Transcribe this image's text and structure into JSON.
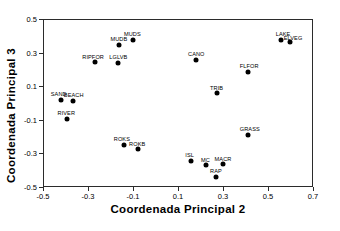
{
  "chart_data": {
    "type": "scatter",
    "title": "",
    "xlabel": "Coordenada Principal 2",
    "ylabel": "Coordenada Principal 3",
    "xlim": [
      -0.5,
      0.7
    ],
    "ylim": [
      -0.5,
      0.5
    ],
    "xticks": [
      "-0.5",
      "-0.3",
      "-0.1",
      "0.1",
      "0.3",
      "0.5",
      "0.7"
    ],
    "xtick_values": [
      -0.5,
      -0.3,
      -0.1,
      0.1,
      0.3,
      0.5,
      0.7
    ],
    "yticks": [
      "0.5",
      "0.3",
      "0.1",
      "-0.1",
      "-0.3",
      "-0.5"
    ],
    "ytick_values": [
      0.5,
      0.3,
      0.1,
      -0.1,
      -0.3,
      -0.5
    ],
    "grid": false,
    "legend": false,
    "marker_color": "#000000",
    "frame_color": "#2b2b2b",
    "points": [
      {
        "label": "MUDS",
        "x": -0.105,
        "y": 0.383,
        "lx": -0.145,
        "ly": 0.437
      },
      {
        "label": "MUDB",
        "x": -0.165,
        "y": 0.352,
        "lx": -0.205,
        "ly": 0.405
      },
      {
        "label": "LAKE",
        "x": 0.555,
        "y": 0.383,
        "lx": 0.53,
        "ly": 0.437
      },
      {
        "label": "ELVEG",
        "x": 0.595,
        "y": 0.368,
        "lx": 0.565,
        "ly": 0.412
      },
      {
        "label": "RIPFOR",
        "x": -0.275,
        "y": 0.25,
        "lx": -0.33,
        "ly": 0.3
      },
      {
        "label": "LGLVB",
        "x": -0.17,
        "y": 0.245,
        "lx": -0.21,
        "ly": 0.297
      },
      {
        "label": "CANO",
        "x": 0.175,
        "y": 0.262,
        "lx": 0.14,
        "ly": 0.315
      },
      {
        "label": "FLFOR",
        "x": 0.405,
        "y": 0.193,
        "lx": 0.37,
        "ly": 0.245
      },
      {
        "label": "TRIB",
        "x": 0.27,
        "y": 0.063,
        "lx": 0.238,
        "ly": 0.115
      },
      {
        "label": "SAND",
        "x": -0.425,
        "y": 0.025,
        "lx": -0.47,
        "ly": 0.078
      },
      {
        "label": "BEACH",
        "x": -0.37,
        "y": 0.018,
        "lx": -0.412,
        "ly": 0.072
      },
      {
        "label": "RIVER",
        "x": -0.398,
        "y": -0.087,
        "lx": -0.44,
        "ly": -0.035
      },
      {
        "label": "GRASS",
        "x": 0.408,
        "y": -0.182,
        "lx": 0.37,
        "ly": -0.13
      },
      {
        "label": "ROKS",
        "x": -0.145,
        "y": -0.243,
        "lx": -0.19,
        "ly": -0.192
      },
      {
        "label": "ROKB",
        "x": -0.082,
        "y": -0.268,
        "lx": -0.122,
        "ly": -0.222
      },
      {
        "label": "ISL",
        "x": 0.152,
        "y": -0.337,
        "lx": 0.128,
        "ly": -0.288
      },
      {
        "label": "MC",
        "x": 0.222,
        "y": -0.363,
        "lx": 0.198,
        "ly": -0.313
      },
      {
        "label": "MACR",
        "x": 0.295,
        "y": -0.358,
        "lx": 0.258,
        "ly": -0.308
      },
      {
        "label": "RAP",
        "x": 0.263,
        "y": -0.432,
        "lx": 0.238,
        "ly": -0.382
      }
    ]
  }
}
